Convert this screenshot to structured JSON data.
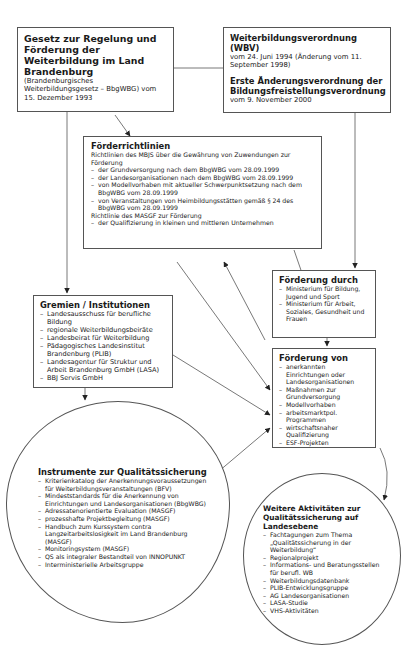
{
  "law": {
    "title": "Gesetz zur Regelung und Förderung der Weiterbildung im Land Brandenburg",
    "subtitle": "(Brandenburgisches Weiterbildungsgesetz – BbgWBG) vom 15. Dezember 1993"
  },
  "regulations": {
    "title1": "Weiterbildungsverordnung (WBV)",
    "text1": "vom 24. Juni 1994 (Änderung vom 11. September 1998)",
    "title2": "Erste Änderungsverordnung der Bildungsfreistellungsverordnung",
    "text2": "vom 9. November 2000"
  },
  "guidelines": {
    "title": "Förderrichtlinien",
    "intro1": "Richtlinien des MBJS über die Gewährung von Zuwendungen zur Förderung",
    "items1": [
      "der Grundversorgung nach dem BbgWBG vom 28.09.1999",
      "der Landesorganisationen nach dem BbgWBG vom 28.09.1999",
      "von Modellvorhaben mit aktueller Schwerpunktsetzung nach dem BbgWBG vom 28.09.1999",
      "von Veranstaltungen von Heimbildungsstätten gemäß § 24 des BbgWBG vom 28.09.1999"
    ],
    "intro2": "Richtlinie des MASGF zur Förderung",
    "items2": [
      "der Qualifizierung in kleinen und mittleren Unternehmen"
    ]
  },
  "funding_by": {
    "title": "Förderung durch",
    "items": [
      "Ministerium für Bildung, Jugend und Sport",
      "Ministerium für Arbeit, Soziales, Gesundheit und Frauen"
    ]
  },
  "bodies": {
    "title": "Gremien / Institutionen",
    "items": [
      "Landesausschuss für berufliche Bildung",
      "regionale Weiterbildungsbeiräte",
      "Landesbeirat für Weiterbildung",
      "Pädagogisches Landesinstitut Brandenburg (PLIB)",
      "Landesagentur für Struktur und Arbeit Brandenburg GmbH (LASA)",
      "BBJ Servis GmbH"
    ]
  },
  "funding_of": {
    "title": "Förderung von",
    "items": [
      "anerkannten Einrichtungen oder Landesorganisationen",
      "Maßnahmen zur Grundversorgung",
      "Modellvorhaben",
      "arbeitsmarktpol. Programmen",
      "wirtschaftsnaher Qualifizierung",
      "ESF-Projekten"
    ]
  },
  "instruments": {
    "title": "Instrumente zur Qualitätssicherung",
    "items": [
      "Kriterienkatalog der Anerkennungsvoraussetzungen für Weiterbildungsveranstaltungen (BFV)",
      "Mindeststandards für die Anerkennung von Einrichtungen und Landesorganisationen (BbgWBG)",
      "Adressatenorientierte Evaluation (MASGF)",
      "prozesshafte Projektbegleitung (MASGF)",
      "Handbuch zum Kurssystem contra Langzeitarbeitslosigkeit im Land Brandenburg (MASGF)",
      "Monitoringsystem (MASGF)",
      "QS als integraler Bestandteil von INNOPUNKT",
      "Interministerielle Arbeitsgruppe"
    ]
  },
  "activities": {
    "title": "Weitere Aktivitäten zur Qualitätssicherung auf Landesebene",
    "items": [
      "Fachtagungen zum Thema „Qualitätssicherung in der Weiterbildung“",
      "Regionalprojekt",
      "Informations- und Beratungsstellen für berufl. WB",
      "Weiterbildungsdatenbank",
      "PLIB-Entwicklungsgruppe",
      "AG Landesorganisationen",
      "LASA-Studie",
      "VHS-Aktivitäten"
    ]
  },
  "colors": {
    "line": "#555555",
    "text": "#1a1a1a",
    "background": "#ffffff"
  }
}
